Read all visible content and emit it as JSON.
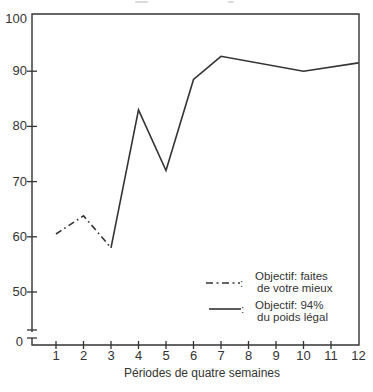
{
  "figure": {
    "background": "#ffffff",
    "ink": "#333333"
  },
  "chart_data": {
    "type": "line",
    "title": "",
    "xlabel": "Périodes de quatre semaines",
    "ylabel": "",
    "x_ticks": [
      "1",
      "2",
      "3",
      "4",
      "5",
      "6",
      "7",
      "8",
      "9",
      "10",
      "11",
      "12"
    ],
    "y_ticks": [
      "100",
      "90",
      "80",
      "70",
      "60",
      "50"
    ],
    "y_origin_label": "0",
    "y_axis_break": true,
    "x_range": [
      1,
      12
    ],
    "y_range_displayed": [
      50,
      100
    ],
    "grid": false,
    "legend_position": "lower-right",
    "series": [
      {
        "name": "Objectif: faites de votre mieux",
        "style": "dash-dot",
        "points": [
          [
            1,
            60.5
          ],
          [
            2,
            63.8
          ],
          [
            3,
            58
          ]
        ]
      },
      {
        "name": "Objectif: 94% du poids légal",
        "style": "solid",
        "points": [
          [
            3,
            58
          ],
          [
            4,
            83
          ],
          [
            5,
            72
          ],
          [
            6,
            88.5
          ],
          [
            7,
            92.7
          ],
          [
            10,
            90
          ],
          [
            12,
            91.5
          ]
        ]
      }
    ],
    "legend": {
      "separator": ":",
      "items": [
        {
          "style": "dash-dot",
          "lines": [
            "Objectif: faites",
            "de votre mieux"
          ]
        },
        {
          "style": "solid",
          "lines": [
            "Objectif: 94%",
            "du poids légal"
          ]
        }
      ]
    }
  }
}
